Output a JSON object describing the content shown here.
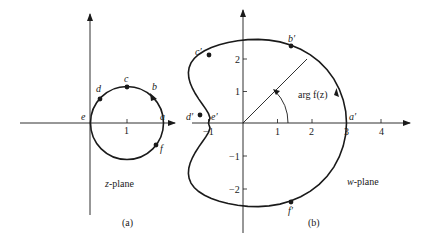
{
  "figure": {
    "panel_a": {
      "caption": "(a)",
      "plane_label_var": "z",
      "plane_label_rest": "-plane",
      "x_tick_label": "1",
      "points": [
        {
          "label": "a"
        },
        {
          "label": "b"
        },
        {
          "label": "c"
        },
        {
          "label": "d"
        },
        {
          "label": "e"
        },
        {
          "label": "f"
        }
      ]
    },
    "panel_b": {
      "caption": "(b)",
      "plane_label_var": "w",
      "plane_label_rest": "-plane",
      "angle_label": "arg f(z)",
      "x_tick_labels": [
        "−1",
        "1",
        "2",
        "3",
        "4"
      ],
      "y_tick_labels": [
        "2",
        "1",
        "−1",
        "−2"
      ],
      "points": [
        {
          "label": "a′"
        },
        {
          "label": "b′"
        },
        {
          "label": "c′"
        },
        {
          "label": "d′"
        },
        {
          "label": "e′"
        },
        {
          "label": "f′"
        }
      ]
    },
    "colors": {
      "ink": "#1a1a1a",
      "background": "#ffffff"
    }
  }
}
